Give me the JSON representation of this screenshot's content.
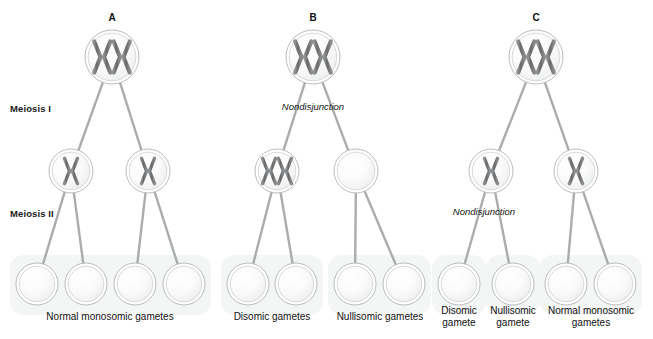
{
  "figure": {
    "width": 653,
    "height": 339,
    "background_color": "#ffffff",
    "cell_outline_color": "#b9bcbd",
    "cell_fill_color": "#f7f8f8",
    "chromosome_color": "#6f7173",
    "connector_color": "#a9adae",
    "gamete_band_color": "#f2f3f3"
  },
  "stage_labels": [
    {
      "id": "meiosis-i",
      "text": "Meiosis I",
      "x": 10,
      "y": 103
    },
    {
      "id": "meiosis-ii",
      "text": "Meiosis II",
      "x": 10,
      "y": 208
    }
  ],
  "panels": [
    {
      "id": "panel-a",
      "letter": "A",
      "letter_x": 112,
      "letter_y": 12,
      "description": "Normal meiosis with no nondisjunction",
      "nondisjunction_label": null,
      "parent": {
        "x": 112,
        "y": 57,
        "r": 27,
        "chromosomes": 2,
        "type": "replicated"
      },
      "meiosis_i_cells": [
        {
          "x": 71,
          "y": 171,
          "r": 22,
          "chromosomes": 1,
          "type": "replicated"
        },
        {
          "x": 148,
          "y": 171,
          "r": 22,
          "chromosomes": 1,
          "type": "replicated"
        }
      ],
      "gametes": [
        {
          "x": 37,
          "y": 284,
          "r": 21,
          "chromatids": 1
        },
        {
          "x": 86,
          "y": 284,
          "r": 21,
          "chromatids": 1
        },
        {
          "x": 135,
          "y": 284,
          "r": 21,
          "chromatids": 1
        },
        {
          "x": 184,
          "y": 284,
          "r": 21,
          "chromatids": 1
        }
      ],
      "captions": [
        {
          "id": "caption-a-normal",
          "text": "Normal monosomic gametes",
          "x": 110,
          "y": 311,
          "width": 190
        }
      ]
    },
    {
      "id": "panel-b",
      "letter": "B",
      "letter_x": 313,
      "letter_y": 12,
      "description": "Nondisjunction in meiosis I",
      "nondisjunction_label": {
        "text": "Nondisjunction",
        "x": 313,
        "y": 101
      },
      "parent": {
        "x": 313,
        "y": 57,
        "r": 27,
        "chromosomes": 2,
        "type": "replicated"
      },
      "meiosis_i_cells": [
        {
          "x": 277,
          "y": 171,
          "r": 22,
          "chromosomes": 2,
          "type": "replicated"
        },
        {
          "x": 356,
          "y": 171,
          "r": 22,
          "chromosomes": 0,
          "type": "empty"
        }
      ],
      "gametes": [
        {
          "x": 248,
          "y": 284,
          "r": 21,
          "chromatids": 2
        },
        {
          "x": 296,
          "y": 284,
          "r": 21,
          "chromatids": 2
        },
        {
          "x": 355,
          "y": 284,
          "r": 21,
          "chromatids": 0
        },
        {
          "x": 404,
          "y": 284,
          "r": 21,
          "chromatids": 0
        }
      ],
      "captions": [
        {
          "id": "caption-b-disomic",
          "text": "Disomic gametes",
          "x": 272,
          "y": 311,
          "width": 130
        },
        {
          "id": "caption-b-nullisomic",
          "text": "Nullisomic gametes",
          "x": 380,
          "y": 311,
          "width": 140
        }
      ]
    },
    {
      "id": "panel-c",
      "letter": "C",
      "letter_x": 536,
      "letter_y": 12,
      "description": "Nondisjunction in meiosis II",
      "nondisjunction_label": {
        "text": "Nondisjunction",
        "x": 484,
        "y": 206
      },
      "parent": {
        "x": 536,
        "y": 57,
        "r": 27,
        "chromosomes": 2,
        "type": "replicated"
      },
      "meiosis_i_cells": [
        {
          "x": 491,
          "y": 171,
          "r": 22,
          "chromosomes": 1,
          "type": "replicated"
        },
        {
          "x": 576,
          "y": 171,
          "r": 22,
          "chromosomes": 1,
          "type": "replicated"
        }
      ],
      "gametes": [
        {
          "x": 459,
          "y": 284,
          "r": 21,
          "chromatids": 2
        },
        {
          "x": 513,
          "y": 284,
          "r": 21,
          "chromatids": 0
        },
        {
          "x": 566,
          "y": 284,
          "r": 21,
          "chromatids": 1
        },
        {
          "x": 615,
          "y": 284,
          "r": 21,
          "chromatids": 1
        }
      ],
      "captions": [
        {
          "id": "caption-c-disomic",
          "text": "Disomic\ngamete",
          "x": 459,
          "y": 305,
          "width": 62
        },
        {
          "id": "caption-c-nullisomic",
          "text": "Nullisomic\ngamete",
          "x": 513,
          "y": 305,
          "width": 68
        },
        {
          "id": "caption-c-normal",
          "text": "Normal monosomic\ngametes",
          "x": 591,
          "y": 305,
          "width": 120
        }
      ]
    }
  ],
  "legend_terms": {
    "normal_monosomic": "Normal monosomic gametes",
    "disomic_plural": "Disomic gametes",
    "nullisomic_plural": "Nullisomic gametes",
    "disomic_singular": "Disomic gamete",
    "nullisomic_singular": "Nullisomic gamete",
    "nondisjunction": "Nondisjunction"
  }
}
